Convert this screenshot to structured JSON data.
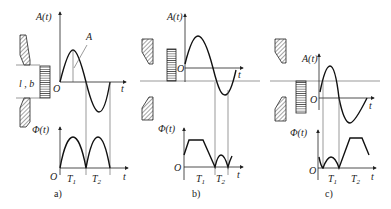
{
  "figure": {
    "panels": [
      {
        "id": "a",
        "caption": "a)",
        "top_label": "A(t)",
        "bottom_label": "Φ(t)",
        "amplitude_label": "A",
        "gap_label": "l , b",
        "origin": "O",
        "t_axis": "t",
        "t1": "T",
        "t1_sub": "1",
        "t2": "T",
        "t2_sub": "2"
      },
      {
        "id": "b",
        "caption": "b)",
        "top_label": "A(t)",
        "bottom_label": "Φ(t)",
        "origin": "O",
        "t_axis": "t",
        "t1": "T",
        "t1_sub": "1",
        "t2": "T",
        "t2_sub": "2"
      },
      {
        "id": "c",
        "caption": "c)",
        "top_label": "A(t)",
        "bottom_label": "Φ(t)",
        "origin": "O",
        "t_axis": "t",
        "t1": "T",
        "t1_sub": "1",
        "t2": "T",
        "t2_sub": "2"
      }
    ]
  }
}
